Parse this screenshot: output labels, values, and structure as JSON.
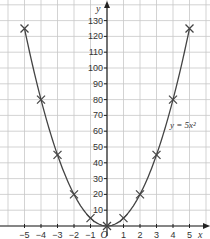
{
  "chart_data": {
    "type": "line",
    "title": "",
    "xlabel": "x",
    "ylabel": "y",
    "origin_label": "O",
    "equation_label": "y = 5x²",
    "x": [
      -5,
      -4,
      -3,
      -2,
      -1,
      0,
      1,
      2,
      3,
      4,
      5
    ],
    "series": [
      {
        "name": "y = 5x²",
        "values": [
          125,
          80,
          45,
          20,
          5,
          0,
          5,
          20,
          45,
          80,
          125
        ],
        "marker": "x"
      }
    ],
    "xticks": [
      -5,
      -4,
      -3,
      -2,
      -1,
      1,
      2,
      3,
      4,
      5
    ],
    "xtick_labels": [
      "−5",
      "−4",
      "−3",
      "−2",
      "−1",
      "1",
      "2",
      "3",
      "4",
      "5"
    ],
    "yticks": [
      10,
      20,
      30,
      40,
      50,
      60,
      70,
      80,
      90,
      100,
      110,
      120,
      130
    ],
    "xlim": [
      -5.5,
      5.5
    ],
    "ylim": [
      0,
      135
    ],
    "grid": true,
    "legend": "inline label near curve"
  },
  "colors": {
    "grid": "#c8c8c8",
    "axis": "#222222",
    "curve": "#444444",
    "marker": "#444444",
    "text": "#333333"
  }
}
